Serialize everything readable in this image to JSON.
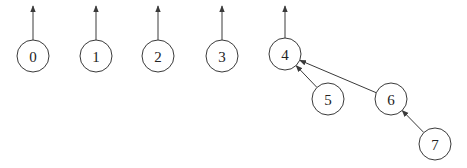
{
  "diagram": {
    "type": "union-find forest",
    "nodes": [
      {
        "id": "0",
        "label": "0",
        "parent": null
      },
      {
        "id": "1",
        "label": "1",
        "parent": null
      },
      {
        "id": "2",
        "label": "2",
        "parent": null
      },
      {
        "id": "3",
        "label": "3",
        "parent": null
      },
      {
        "id": "4",
        "label": "4",
        "parent": null
      },
      {
        "id": "5",
        "label": "5",
        "parent": "4"
      },
      {
        "id": "6",
        "label": "6",
        "parent": "4"
      },
      {
        "id": "7",
        "label": "7",
        "parent": "6"
      }
    ],
    "colors": {
      "stroke": "#3a3a3a",
      "text": "#222222",
      "background": "#ffffff"
    }
  }
}
